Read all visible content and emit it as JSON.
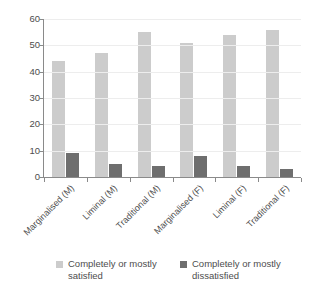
{
  "chart_data": {
    "type": "bar",
    "title": "",
    "subtitle": "",
    "xlabel": "",
    "ylabel": "",
    "ylim": [
      0,
      60
    ],
    "ytick_values": [
      0,
      10,
      20,
      30,
      40,
      50,
      60
    ],
    "ytick_labels": [
      "0",
      "10",
      "20",
      "30",
      "40",
      "50",
      "60"
    ],
    "grid": true,
    "grid_axis": "y",
    "legend_position": "bottom",
    "categories": [
      "Marginalised (M)",
      "Liminal (M)",
      "Traditional (M)",
      "Marginalised (F)",
      "Liminal (F)",
      "Traditional (F)"
    ],
    "series": [
      {
        "name": "Completely or mostly satisfied",
        "color": "#cccccc",
        "values": [
          44,
          47,
          55,
          51,
          54,
          56
        ]
      },
      {
        "name": "Completely or mostly dissatisfied",
        "color": "#6e6e6e",
        "values": [
          9,
          5,
          4,
          8,
          4,
          3
        ]
      }
    ]
  },
  "legend": {
    "items": [
      {
        "label": "Completely or mostly satisfied",
        "color": "#cccccc"
      },
      {
        "label": "Completely or mostly dissatisfied",
        "color": "#6e6e6e"
      }
    ]
  },
  "colors": {
    "satisfied": "#cccccc",
    "dissatisfied": "#6e6e6e",
    "axis": "#8a8a8a",
    "gridline": "#ededed",
    "text": "#4d4d4d",
    "background": "#ffffff"
  }
}
